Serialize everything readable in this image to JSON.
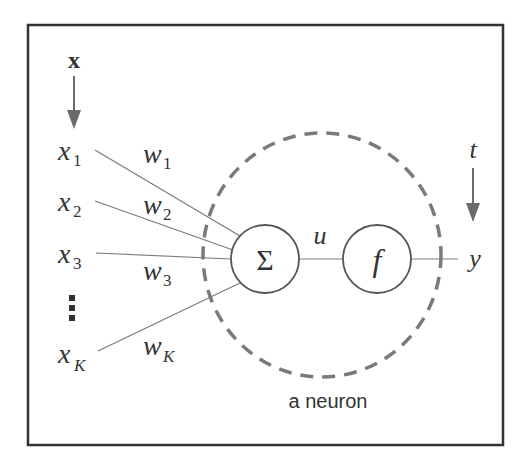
{
  "diagram": {
    "input_vector_label": "x",
    "target_label": "t",
    "inputs": [
      {
        "name": "x",
        "sub": "1",
        "weight": "w",
        "weight_sub": "1"
      },
      {
        "name": "x",
        "sub": "2",
        "weight": "w",
        "weight_sub": "2"
      },
      {
        "name": "x",
        "sub": "3",
        "weight": "w",
        "weight_sub": "3"
      },
      {
        "name": "x",
        "sub": "K",
        "weight": "w",
        "weight_sub": "K"
      }
    ],
    "ellipsis": "⋮",
    "sum_node": {
      "symbol": "Σ"
    },
    "activation_node": {
      "symbol": "f"
    },
    "intermediate_label": "u",
    "output_label": "y",
    "neuron_caption": "a neuron",
    "colors": {
      "frame": "#333333",
      "wires": "#7a7a7a",
      "dashed_boundary": "#7a7a7a",
      "text": "#333333"
    }
  }
}
